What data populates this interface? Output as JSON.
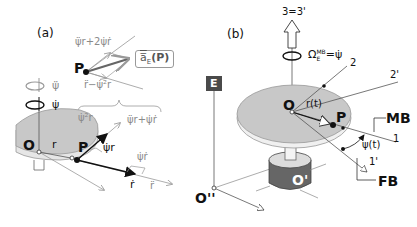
{
  "panels": {
    "a": {
      "label": "(a)",
      "point_P": "P",
      "origin_O": "O",
      "radius_r": "r",
      "transverse_accel": "ψ̈r+2ψ̇ṙ",
      "radial_accel": "r̈−ψ̇²r",
      "accel_label": "a̅",
      "accel_sub": "E",
      "accel_arg": "(P)",
      "rot_accel_symbol": "ψ̈",
      "rot_rate_symbol": "ψ̇",
      "centripetal": "ψ̇²r",
      "transverse_sum": "ψ̈r+ψ̇ṙ",
      "velocity_transverse": "ψ̇r",
      "coriolis_part": "ψ̇ṙ",
      "radial_velocity": "ṙ",
      "radial_accel_short": "r̈"
    },
    "b": {
      "label": "(b)",
      "axis_3": "3=3'",
      "omega": "Ω",
      "omega_sup": "MB",
      "omega_sub": "E",
      "omega_eq": "=ψ̇",
      "axis_2": "2",
      "axis_2p": "2'",
      "frame_E": "E",
      "origin_O": "O",
      "radius_rt": "r(t)",
      "point_P": "P",
      "frame_MB": "MB",
      "axis_1": "1",
      "angle": "ψ(t)",
      "axis_1p": "1'",
      "frame_FB": "FB",
      "origin_Opp": "O''",
      "origin_Op": "O'"
    }
  },
  "colors": {
    "disk_fill": "#c8c8c8",
    "disk_edge": "#e8e8e8",
    "base_fill": "#666666",
    "frame_E_bg": "#4a4a4a",
    "gray_vector": "#8a8a8a",
    "dark_vector": "#111111"
  }
}
